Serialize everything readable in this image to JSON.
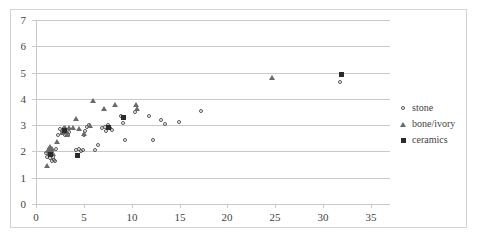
{
  "chart_data": {
    "type": "scatter",
    "title": "",
    "xlabel": "",
    "ylabel": "",
    "xlim": [
      0,
      37
    ],
    "ylim": [
      0,
      7
    ],
    "xticks": [
      0,
      5,
      10,
      15,
      20,
      25,
      30,
      35
    ],
    "yticks": [
      0,
      1,
      2,
      3,
      4,
      5,
      6,
      7
    ],
    "grid": "horizontal",
    "legend_position": "right",
    "series": [
      {
        "name": "stone",
        "marker": "open-circle",
        "color": "#555555",
        "points": [
          [
            1.2,
            1.9
          ],
          [
            1.3,
            1.75
          ],
          [
            1.5,
            1.85
          ],
          [
            1.5,
            2.05
          ],
          [
            1.6,
            1.7
          ],
          [
            1.7,
            1.95
          ],
          [
            1.8,
            1.6
          ],
          [
            1.9,
            1.75
          ],
          [
            2.0,
            1.62
          ],
          [
            2.1,
            1.6
          ],
          [
            2.2,
            2.05
          ],
          [
            2.4,
            2.6
          ],
          [
            2.6,
            2.8
          ],
          [
            2.8,
            2.75
          ],
          [
            3.0,
            2.7
          ],
          [
            3.0,
            2.85
          ],
          [
            3.1,
            2.6
          ],
          [
            3.3,
            2.65
          ],
          [
            3.5,
            2.6
          ],
          [
            3.6,
            2.7
          ],
          [
            4.3,
            2.0
          ],
          [
            4.6,
            2.05
          ],
          [
            4.8,
            1.98
          ],
          [
            5.0,
            2.0
          ],
          [
            5.1,
            2.6
          ],
          [
            5.2,
            2.75
          ],
          [
            5.4,
            2.9
          ],
          [
            5.6,
            2.95
          ],
          [
            6.3,
            2.02
          ],
          [
            6.6,
            2.2
          ],
          [
            7.0,
            2.85
          ],
          [
            7.3,
            2.9
          ],
          [
            7.4,
            2.75
          ],
          [
            7.6,
            2.95
          ],
          [
            7.8,
            2.85
          ],
          [
            8.0,
            2.78
          ],
          [
            9.0,
            3.3
          ],
          [
            9.2,
            3.05
          ],
          [
            9.4,
            2.4
          ],
          [
            10.4,
            3.45
          ],
          [
            11.9,
            3.3
          ],
          [
            12.3,
            2.4
          ],
          [
            13.2,
            3.15
          ],
          [
            13.6,
            3.0
          ],
          [
            15.1,
            3.1
          ],
          [
            17.4,
            3.5
          ],
          [
            31.9,
            4.6
          ]
        ]
      },
      {
        "name": "bone/ivory",
        "marker": "open-triangle",
        "color": "#6a6a6a",
        "points": [
          [
            1.1,
            1.45
          ],
          [
            1.3,
            2.0
          ],
          [
            1.4,
            2.1
          ],
          [
            1.5,
            2.15
          ],
          [
            1.6,
            2.05
          ],
          [
            1.7,
            2.1
          ],
          [
            1.8,
            1.9
          ],
          [
            2.2,
            2.35
          ],
          [
            2.7,
            2.7
          ],
          [
            2.9,
            2.8
          ],
          [
            3.0,
            2.9
          ],
          [
            3.1,
            2.78
          ],
          [
            3.2,
            2.62
          ],
          [
            3.4,
            2.9
          ],
          [
            3.9,
            2.9
          ],
          [
            4.2,
            3.25
          ],
          [
            4.5,
            2.85
          ],
          [
            5.0,
            2.65
          ],
          [
            5.6,
            2.95
          ],
          [
            6.0,
            3.9
          ],
          [
            7.1,
            3.6
          ],
          [
            8.3,
            3.75
          ],
          [
            10.5,
            3.75
          ],
          [
            10.6,
            3.62
          ],
          [
            24.7,
            4.8
          ]
        ]
      },
      {
        "name": "ceramics",
        "marker": "filled-square",
        "color": "#2b2b2b",
        "points": [
          [
            1.5,
            1.9
          ],
          [
            3.0,
            2.78
          ],
          [
            4.3,
            1.85
          ],
          [
            7.6,
            2.92
          ],
          [
            9.1,
            3.3
          ],
          [
            31.9,
            4.92
          ]
        ]
      }
    ]
  },
  "legend": {
    "items": [
      {
        "label": "stone",
        "marker": "open-circle"
      },
      {
        "label": "bone/ivory",
        "marker": "open-triangle"
      },
      {
        "label": "ceramics",
        "marker": "filled-square"
      }
    ]
  }
}
